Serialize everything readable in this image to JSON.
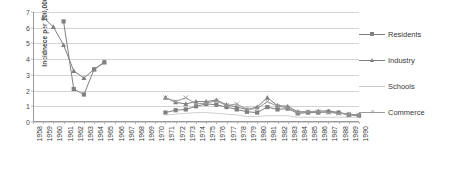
{
  "chart_data": {
    "type": "line",
    "title": "",
    "xlabel": "",
    "ylabel": "Incidnece per 100,000",
    "ylim": [
      0,
      7
    ],
    "yticks": [
      0,
      1,
      2,
      3,
      4,
      5,
      6,
      7
    ],
    "grid": true,
    "legend_position": "right",
    "categories": [
      "1958",
      "1959",
      "1960",
      "1961",
      "1962",
      "1963",
      "1964",
      "1965",
      "1966",
      "1967",
      "1968",
      "1969",
      "1970",
      "1971",
      "1972",
      "1973",
      "1974",
      "1975",
      "1976",
      "1977",
      "1978",
      "1979",
      "1980",
      "1981",
      "1982",
      "1983",
      "1984",
      "1985",
      "1986",
      "1987",
      "1988",
      "1989",
      "1990"
    ],
    "series": [
      {
        "name": "Residents",
        "marker": "square",
        "color": "#808080",
        "values": [
          null,
          null,
          null,
          6.4,
          2.1,
          1.75,
          3.35,
          3.8,
          null,
          null,
          null,
          null,
          null,
          0.6,
          0.75,
          0.8,
          1.0,
          1.15,
          1.1,
          0.95,
          0.8,
          0.65,
          0.6,
          0.95,
          0.8,
          0.85,
          0.55,
          0.6,
          0.6,
          0.65,
          0.6,
          0.45,
          0.4
        ]
      },
      {
        "name": "Industry",
        "marker": "triangle",
        "color": "#7f7f7f",
        "values": [
          null,
          6.65,
          6.05,
          4.9,
          3.25,
          2.8,
          3.35,
          3.8,
          null,
          null,
          null,
          null,
          null,
          1.55,
          1.25,
          1.15,
          1.3,
          1.3,
          1.4,
          1.1,
          0.95,
          0.8,
          0.95,
          1.55,
          1.05,
          1.0,
          0.65,
          0.65,
          0.7,
          0.7,
          0.6,
          0.5,
          0.45
        ]
      },
      {
        "name": "Schools",
        "marker": "none",
        "color": "#c9c9c9",
        "values": [
          null,
          null,
          null,
          null,
          null,
          null,
          null,
          null,
          null,
          null,
          null,
          null,
          null,
          0.45,
          0.5,
          0.55,
          0.6,
          0.6,
          0.55,
          0.5,
          0.45,
          0.35,
          0.35,
          0.4,
          0.4,
          0.4,
          0.3,
          0.3,
          0.3,
          0.3,
          0.3,
          0.3,
          0.3
        ]
      },
      {
        "name": "Commerce",
        "marker": "x",
        "color": "#9a9a9a",
        "values": [
          null,
          null,
          null,
          null,
          null,
          null,
          null,
          null,
          null,
          null,
          null,
          null,
          null,
          1.55,
          1.3,
          1.55,
          1.15,
          1.2,
          1.35,
          1.05,
          1.15,
          0.8,
          0.85,
          1.3,
          1.0,
          0.9,
          0.6,
          0.65,
          0.65,
          0.6,
          0.55,
          0.5,
          0.45
        ]
      }
    ]
  },
  "legend": {
    "entries": [
      {
        "label": "Residents"
      },
      {
        "label": "Industry"
      },
      {
        "label": "Schools"
      },
      {
        "label": "Commerce"
      }
    ]
  }
}
